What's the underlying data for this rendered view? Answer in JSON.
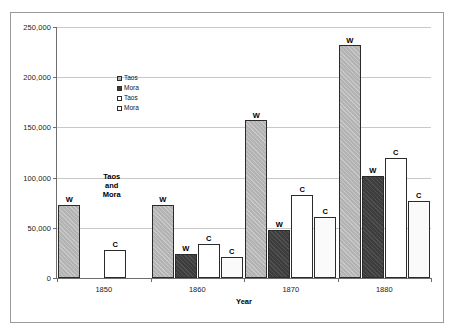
{
  "chart_data": {
    "type": "bar",
    "title": "",
    "xlabel": "Year",
    "ylabel": "",
    "categories": [
      "1850",
      "1860",
      "1870",
      "1880"
    ],
    "ylim": [
      0,
      250000
    ],
    "ytick_labels": [
      "0",
      "50,000",
      "100,000",
      "150,000",
      "200,000",
      "250,000"
    ],
    "ytick_values": [
      0,
      50000,
      100000,
      150000,
      200000,
      250000
    ],
    "grid": true,
    "legend_position": "inside-upper-left",
    "series": [
      {
        "name": "Taos",
        "key": "taos_w",
        "fill": "gray-hatch",
        "point_label": "W",
        "values": [
          73000,
          73000,
          157000,
          232000
        ]
      },
      {
        "name": "Mora",
        "key": "mora_w",
        "fill": "dark",
        "point_label": "W",
        "values": [
          null,
          24000,
          48000,
          102000
        ]
      },
      {
        "name": "Taos",
        "key": "taos_c",
        "fill": "white",
        "point_label": "C",
        "values": [
          28000,
          34000,
          83000,
          120000
        ]
      },
      {
        "name": "Mora",
        "key": "mora_c",
        "fill": "offwhite",
        "point_label": "C",
        "values": [
          null,
          21000,
          61000,
          77000
        ]
      }
    ],
    "annotations": [
      {
        "text": "Taos\nand\nMora",
        "near_category": "1850"
      }
    ]
  },
  "legend": {
    "items": [
      {
        "label": "Taos",
        "swatch": "gray-hatch"
      },
      {
        "label": "Mora",
        "swatch": "dark"
      },
      {
        "label": "Taos",
        "swatch": "white"
      },
      {
        "label": "Mora",
        "swatch": "offwhite"
      }
    ]
  },
  "colors": {
    "series_gray": "#b3b3b3",
    "series_dark": "#3d3d3d",
    "series_white": "#ffffff",
    "series_offwhite": "#fafafa",
    "grid": "#c8c8c8",
    "axis": "#6e6e6e",
    "frame": "#9a9a9a",
    "text": "#1a1a1a"
  }
}
